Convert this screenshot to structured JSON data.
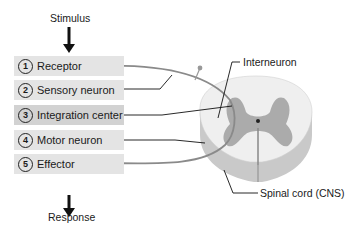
{
  "diagram": {
    "top_label": "Stimulus",
    "bottom_label": "Response",
    "steps": [
      {
        "number": "1",
        "label": "Receptor"
      },
      {
        "number": "2",
        "label": "Sensory neuron"
      },
      {
        "number": "3",
        "label": "Integration center"
      },
      {
        "number": "4",
        "label": "Motor neuron"
      },
      {
        "number": "5",
        "label": "Effector"
      }
    ],
    "callouts": {
      "interneuron": "Interneuron",
      "spinal_cord": "Spinal cord (CNS)"
    },
    "colors": {
      "step_bg": "#e4e4e4",
      "step_bg_highlight": "#d2d2d2",
      "gray_matter": "#a9a9a9",
      "white_matter": "#ececec",
      "nerve": "#8a8a8a"
    }
  }
}
